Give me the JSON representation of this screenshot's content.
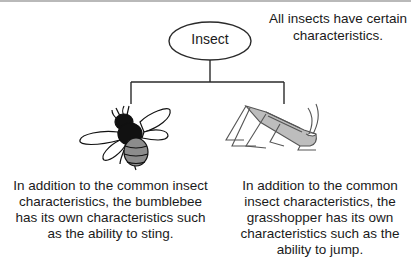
{
  "root": {
    "label": "Insect",
    "caption": "All insects have certain characteristics."
  },
  "children": [
    {
      "name": "bumblebee",
      "icon": "bumblebee-illustration",
      "description": "In addition to the common insect characteristics, the bumblebee has its own characteristics such as the ability to sting."
    },
    {
      "name": "grasshopper",
      "icon": "grasshopper-illustration",
      "description": "In addition to the common insect characteristics, the grasshopper has its own characteristics such as the ability to jump."
    }
  ],
  "colors": {
    "line": "#2a2a2a",
    "bee_body": "#111111",
    "bee_stripe": "#8c8c8c",
    "grasshopper": "#9a9a9a"
  }
}
